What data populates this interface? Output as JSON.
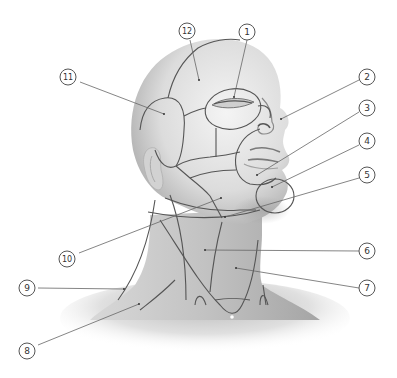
{
  "figure": {
    "type": "anatomical diagram"
  },
  "labels": [
    {
      "id": "1",
      "text": "1",
      "x": 247,
      "y": 32,
      "target": [
        234,
        97
      ]
    },
    {
      "id": "2",
      "text": "2",
      "x": 367,
      "y": 77,
      "target": [
        281,
        119
      ]
    },
    {
      "id": "3",
      "text": "3",
      "x": 367,
      "y": 108,
      "target": [
        257,
        175
      ]
    },
    {
      "id": "4",
      "text": "4",
      "x": 367,
      "y": 141,
      "target": [
        272,
        187
      ]
    },
    {
      "id": "5",
      "text": "5",
      "x": 367,
      "y": 175,
      "target": [
        225,
        217
      ]
    },
    {
      "id": "6",
      "text": "6",
      "x": 367,
      "y": 251,
      "target": [
        205,
        250
      ]
    },
    {
      "id": "7",
      "text": "7",
      "x": 367,
      "y": 288,
      "target": [
        236,
        268
      ]
    },
    {
      "id": "8",
      "text": "8",
      "x": 27,
      "y": 351,
      "target": [
        139,
        304
      ]
    },
    {
      "id": "9",
      "text": "9",
      "x": 27,
      "y": 288,
      "target": [
        124,
        289
      ]
    },
    {
      "id": "10",
      "text": "10",
      "x": 67,
      "y": 259,
      "target": [
        221,
        198
      ]
    },
    {
      "id": "11",
      "text": "11",
      "x": 68,
      "y": 77,
      "target": [
        164,
        114
      ]
    },
    {
      "id": "12",
      "text": "12",
      "x": 187,
      "y": 31,
      "target": [
        199,
        80
      ]
    }
  ],
  "colors": {
    "background": "#ffffff",
    "skin_light": "#ebebeb",
    "skin_mid": "#c9c9c9",
    "skin_dark": "#9a9a9a",
    "region_line": "#555555",
    "leader_line": "#666666",
    "label_border": "#555555",
    "label_text": "#333333"
  }
}
